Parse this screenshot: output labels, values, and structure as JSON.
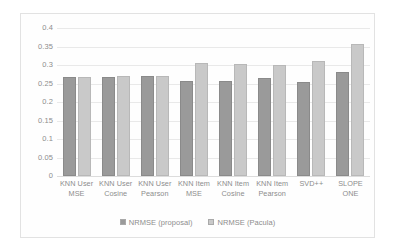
{
  "chart_data": {
    "type": "bar",
    "title": "",
    "subtitle": "",
    "xlabel": "",
    "ylabel": "",
    "ylim": [
      0,
      0.4
    ],
    "yticks": [
      "0",
      "0.05",
      "0.1",
      "0.15",
      "0.2",
      "0.25",
      "0.3",
      "0.35",
      "0.4"
    ],
    "ytick_values": [
      0,
      0.05,
      0.1,
      0.15,
      0.2,
      0.25,
      0.3,
      0.35,
      0.4
    ],
    "grid": true,
    "legend_position": "bottom",
    "categories": [
      "KNN User MSE",
      "KNN User Cosine",
      "KNN User Pearson",
      "KNN Item MSE",
      "KNN Item Cosine",
      "KNN Item Pearson",
      "SVD++",
      "SLOPE ONE"
    ],
    "category_lines": [
      [
        "KNN User",
        "MSE"
      ],
      [
        "KNN User",
        "Cosine"
      ],
      [
        "KNN User",
        "Pearson"
      ],
      [
        "KNN Item",
        "MSE"
      ],
      [
        "KNN Item",
        "Cosine"
      ],
      [
        "KNN Item",
        "Pearson"
      ],
      [
        "SVD++",
        ""
      ],
      [
        "SLOPE",
        "ONE"
      ]
    ],
    "series": [
      {
        "name": "NRMSE (proposal)",
        "color": "#9a9a9a",
        "values": [
          0.268,
          0.267,
          0.271,
          0.258,
          0.257,
          0.266,
          0.253,
          0.282
        ]
      },
      {
        "name": "NRMSE (Pacula)",
        "color": "#c9c9c9",
        "values": [
          0.268,
          0.271,
          0.269,
          0.305,
          0.304,
          0.299,
          0.311,
          0.357
        ]
      }
    ]
  }
}
